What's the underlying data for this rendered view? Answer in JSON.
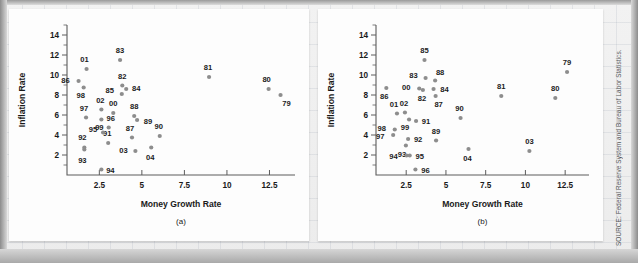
{
  "figure": {
    "source_note": "SOURCE: Federal Reserve System and Bureau of Labor Statistics.",
    "dot_color": "#8d8d8d",
    "axis_color": "#5c5c5c"
  },
  "chart_data": [
    {
      "type": "scatter",
      "title": "",
      "caption": "(a)",
      "xlabel": "Money Growth Rate",
      "ylabel": "Inflation Rate",
      "xlim": [
        0.6,
        14.0
      ],
      "ylim": [
        0.0,
        15.0
      ],
      "xticks": [
        2.5,
        5,
        7.5,
        10,
        12.5
      ],
      "xticklabels": [
        "2.5",
        "5",
        "7.5",
        "10",
        "12.5"
      ],
      "yticks": [
        2,
        4,
        6,
        8,
        10,
        12,
        14
      ],
      "yticklabels": [
        "2",
        "4",
        "6",
        "8",
        "10",
        "12",
        "14"
      ],
      "grid": false,
      "points": [
        {
          "label": "79",
          "x": 13.15,
          "y": 8.0,
          "lx": 6,
          "ly": 11
        },
        {
          "label": "80",
          "x": 12.45,
          "y": 8.6,
          "lx": -2,
          "ly": -7
        },
        {
          "label": "81",
          "x": 8.95,
          "y": 9.8,
          "lx": -1,
          "ly": -7
        },
        {
          "label": "82",
          "x": 3.85,
          "y": 8.95,
          "lx": 0,
          "ly": -7
        },
        {
          "label": "83",
          "x": 3.72,
          "y": 11.5,
          "lx": 0,
          "ly": -7
        },
        {
          "label": "84",
          "x": 4.08,
          "y": 8.6,
          "lx": 10,
          "ly": 2
        },
        {
          "label": "85",
          "x": 3.82,
          "y": 8.1,
          "lx": -12,
          "ly": -1
        },
        {
          "label": "86",
          "x": 1.28,
          "y": 9.4,
          "lx": -13,
          "ly": 2
        },
        {
          "label": "87",
          "x": 4.42,
          "y": 3.75,
          "lx": -2,
          "ly": -7
        },
        {
          "label": "88",
          "x": 4.55,
          "y": 5.9,
          "lx": 0,
          "ly": -7
        },
        {
          "label": "89",
          "x": 4.72,
          "y": 5.5,
          "lx": 11,
          "ly": 4
        },
        {
          "label": "90",
          "x": 6.05,
          "y": 3.9,
          "lx": -1,
          "ly": -7
        },
        {
          "label": "91",
          "x": 3.02,
          "y": 3.2,
          "lx": -1,
          "ly": -7
        },
        {
          "label": "92",
          "x": 1.62,
          "y": 2.75,
          "lx": -2,
          "ly": -8
        },
        {
          "label": "93",
          "x": 1.62,
          "y": 2.55,
          "lx": -2,
          "ly": 13
        },
        {
          "label": "94",
          "x": 2.62,
          "y": 0.55,
          "lx": 9,
          "ly": 3
        },
        {
          "label": "95",
          "x": 2.72,
          "y": 4.25,
          "lx": -10,
          "ly": -1
        },
        {
          "label": "96",
          "x": 3.05,
          "y": 4.75,
          "lx": 2,
          "ly": -7
        },
        {
          "label": "97",
          "x": 1.72,
          "y": 5.75,
          "lx": -2,
          "ly": -7
        },
        {
          "label": "98",
          "x": 1.58,
          "y": 8.75,
          "lx": -3,
          "ly": 10
        },
        {
          "label": "99",
          "x": 2.62,
          "y": 5.55,
          "lx": -2,
          "ly": 10
        },
        {
          "label": "00",
          "x": 3.32,
          "y": 6.2,
          "lx": 0,
          "ly": -7
        },
        {
          "label": "01",
          "x": 1.75,
          "y": 10.6,
          "lx": -2,
          "ly": -7
        },
        {
          "label": "02",
          "x": 2.62,
          "y": 6.55,
          "lx": -1,
          "ly": -7
        },
        {
          "label": "03",
          "x": 4.62,
          "y": 2.4,
          "lx": -12,
          "ly": 2
        },
        {
          "label": "04",
          "x": 5.55,
          "y": 2.75,
          "lx": -1,
          "ly": 12
        }
      ]
    },
    {
      "type": "scatter",
      "title": "",
      "caption": "(b)",
      "xlabel": "Money Growth Rate",
      "ylabel": "Inflation Rate",
      "xlim": [
        0.6,
        14.0
      ],
      "ylim": [
        0.0,
        15.0
      ],
      "xticks": [
        2.5,
        5,
        7.5,
        10,
        12.5
      ],
      "xticklabels": [
        "2.5",
        "5",
        "7.5",
        "10",
        "12.5"
      ],
      "yticks": [
        2,
        4,
        6,
        8,
        10,
        12,
        14
      ],
      "yticklabels": [
        "2",
        "4",
        "6",
        "8",
        "10",
        "12",
        "14"
      ],
      "grid": false,
      "points": [
        {
          "label": "79",
          "x": 12.62,
          "y": 10.3,
          "lx": 0,
          "ly": -7
        },
        {
          "label": "80",
          "x": 11.88,
          "y": 7.7,
          "lx": 0,
          "ly": -7
        },
        {
          "label": "81",
          "x": 8.48,
          "y": 7.9,
          "lx": 0,
          "ly": -7
        },
        {
          "label": "82",
          "x": 3.55,
          "y": 8.5,
          "lx": -1,
          "ly": 11
        },
        {
          "label": "83",
          "x": 3.72,
          "y": 9.7,
          "lx": -12,
          "ly": 0
        },
        {
          "label": "84",
          "x": 4.22,
          "y": 8.6,
          "lx": 11,
          "ly": 3
        },
        {
          "label": "85",
          "x": 3.65,
          "y": 11.5,
          "lx": 0,
          "ly": -7
        },
        {
          "label": "86",
          "x": 1.25,
          "y": 8.7,
          "lx": -2,
          "ly": 11
        },
        {
          "label": "87",
          "x": 4.35,
          "y": 7.9,
          "lx": 3,
          "ly": 11
        },
        {
          "label": "88",
          "x": 4.32,
          "y": 9.45,
          "lx": 5,
          "ly": -6
        },
        {
          "label": "89",
          "x": 4.38,
          "y": 3.45,
          "lx": 0,
          "ly": -7
        },
        {
          "label": "90",
          "x": 5.92,
          "y": 5.7,
          "lx": -1,
          "ly": -7
        },
        {
          "label": "91",
          "x": 3.12,
          "y": 5.4,
          "lx": 10,
          "ly": 3
        },
        {
          "label": "92",
          "x": 2.62,
          "y": 3.6,
          "lx": 10,
          "ly": 3
        },
        {
          "label": "93",
          "x": 2.48,
          "y": 2.95,
          "lx": -4,
          "ly": 11
        },
        {
          "label": "94",
          "x": 2.52,
          "y": 1.95,
          "lx": -13,
          "ly": 3
        },
        {
          "label": "95",
          "x": 2.72,
          "y": 1.95,
          "lx": 10,
          "ly": 3
        },
        {
          "label": "96",
          "x": 3.08,
          "y": 0.55,
          "lx": 10,
          "ly": 3
        },
        {
          "label": "97",
          "x": 1.68,
          "y": 4.0,
          "lx": -13,
          "ly": 4
        },
        {
          "label": "98",
          "x": 1.78,
          "y": 4.55,
          "lx": -13,
          "ly": 1
        },
        {
          "label": "99",
          "x": 2.68,
          "y": 5.55,
          "lx": -4,
          "ly": 10
        },
        {
          "label": "00",
          "x": 3.32,
          "y": 8.65,
          "lx": -13,
          "ly": 1
        },
        {
          "label": "01",
          "x": 1.92,
          "y": 6.15,
          "lx": -3,
          "ly": -7
        },
        {
          "label": "02",
          "x": 2.42,
          "y": 6.25,
          "lx": -1,
          "ly": -7
        },
        {
          "label": "03",
          "x": 10.25,
          "y": 2.4,
          "lx": 0,
          "ly": -7
        },
        {
          "label": "04",
          "x": 6.42,
          "y": 2.6,
          "lx": -1,
          "ly": 12
        }
      ]
    }
  ]
}
